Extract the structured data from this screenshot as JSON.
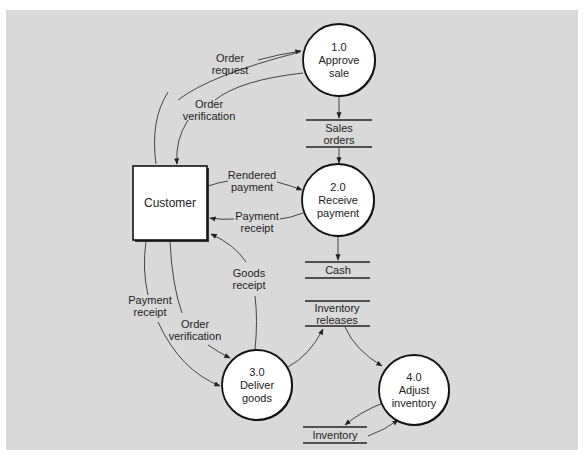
{
  "diagram": {
    "type": "data-flow-diagram",
    "entities": [
      {
        "id": "customer",
        "label": "Customer"
      }
    ],
    "processes": [
      {
        "id": "p1",
        "number": "1.0",
        "name_lines": [
          "Approve",
          "sale"
        ]
      },
      {
        "id": "p2",
        "number": "2.0",
        "name_lines": [
          "Receive",
          "payment"
        ]
      },
      {
        "id": "p3",
        "number": "3.0",
        "name_lines": [
          "Deliver",
          "goods"
        ]
      },
      {
        "id": "p4",
        "number": "4.0",
        "name_lines": [
          "Adjust",
          "inventory"
        ]
      }
    ],
    "data_stores": [
      {
        "id": "sales_orders",
        "label_lines": [
          "Sales",
          "orders"
        ]
      },
      {
        "id": "cash",
        "label_lines": [
          "Cash"
        ]
      },
      {
        "id": "inventory_releases",
        "label_lines": [
          "Inventory",
          "releases"
        ]
      },
      {
        "id": "inventory",
        "label_lines": [
          "Inventory"
        ]
      }
    ],
    "flows": [
      {
        "from": "customer",
        "to": "p1",
        "label_lines": [
          "Order",
          "request"
        ]
      },
      {
        "from": "p1",
        "to": "customer",
        "label_lines": [
          "Order",
          "verification"
        ]
      },
      {
        "from": "p1",
        "to": "sales_orders",
        "label_lines": []
      },
      {
        "from": "sales_orders",
        "to": "p2",
        "label_lines": []
      },
      {
        "from": "customer",
        "to": "p2",
        "label_lines": [
          "Rendered",
          "payment"
        ]
      },
      {
        "from": "p2",
        "to": "customer",
        "label_lines": [
          "Payment",
          "receipt"
        ]
      },
      {
        "from": "p2",
        "to": "cash",
        "label_lines": []
      },
      {
        "from": "p3",
        "to": "customer",
        "label_lines": [
          "Goods",
          "receipt"
        ]
      },
      {
        "from": "customer",
        "to": "p3",
        "label_lines": [
          "Payment",
          "receipt"
        ]
      },
      {
        "from": "customer",
        "to": "p3",
        "label_lines": [
          "Order",
          "verification"
        ]
      },
      {
        "from": "p3",
        "to": "inventory_releases",
        "label_lines": []
      },
      {
        "from": "inventory_releases",
        "to": "p4",
        "label_lines": []
      },
      {
        "from": "p4",
        "to": "inventory",
        "label_lines": []
      },
      {
        "from": "inventory",
        "to": "p4",
        "label_lines": []
      }
    ]
  },
  "labels": {
    "customer": "Customer",
    "p1": {
      "num": "1.0",
      "l1": "Approve",
      "l2": "sale"
    },
    "p2": {
      "num": "2.0",
      "l1": "Receive",
      "l2": "payment"
    },
    "p3": {
      "num": "3.0",
      "l1": "Deliver",
      "l2": "goods"
    },
    "p4": {
      "num": "4.0",
      "l1": "Adjust",
      "l2": "inventory"
    },
    "ds_sales": {
      "l1": "Sales",
      "l2": "orders"
    },
    "ds_cash": {
      "l1": "Cash"
    },
    "ds_invrel": {
      "l1": "Inventory",
      "l2": "releases"
    },
    "ds_inv": {
      "l1": "Inventory"
    },
    "f_order_request": {
      "l1": "Order",
      "l2": "request"
    },
    "f_order_verif_top": {
      "l1": "Order",
      "l2": "verification"
    },
    "f_rendered_payment": {
      "l1": "Rendered",
      "l2": "payment"
    },
    "f_payment_receipt_right": {
      "l1": "Payment",
      "l2": "receipt"
    },
    "f_goods_receipt": {
      "l1": "Goods",
      "l2": "receipt"
    },
    "f_payment_receipt_left": {
      "l1": "Payment",
      "l2": "receipt"
    },
    "f_order_verif_bottom": {
      "l1": "Order",
      "l2": "verification"
    }
  }
}
